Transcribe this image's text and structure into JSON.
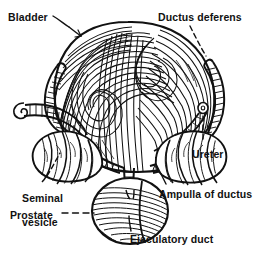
{
  "figure": {
    "kind": "anatomical-line-drawing",
    "style": "black-and-white pen-and-ink engraving with hatched muscle fibers",
    "background_color": "#ffffff",
    "ink_color": "#111111",
    "width": 256,
    "height": 254
  },
  "labels": [
    {
      "id": "bladder",
      "text": "Bladder",
      "x": 8,
      "y": 11,
      "align": "left",
      "leader": "solid",
      "points_to": "bladder-dome"
    },
    {
      "id": "ductus-deferens",
      "text": "Ductus deferens",
      "x": 158,
      "y": 11,
      "align": "left",
      "leader": "dashed",
      "points_to": "right-ductus-deferens"
    },
    {
      "id": "ureter",
      "text": "Ureter",
      "x": 192,
      "y": 148,
      "align": "left",
      "leader": "dashed",
      "points_to": "right-ureter-stump"
    },
    {
      "id": "ampulla-of-ductus",
      "text": "Ampulla of ductus",
      "x": 159,
      "y": 188,
      "align": "left",
      "leader": "solid",
      "points_to": "right-ampulla"
    },
    {
      "id": "seminal-vesicle",
      "text": "Seminal\nvesicle",
      "line1": "Seminal",
      "line2": "vesicle",
      "x": 10,
      "y": 180,
      "align": "left",
      "leader": "dashed",
      "points_to": "left-seminal-vesicle"
    },
    {
      "id": "prostate",
      "text": "Prostate",
      "x": 10,
      "y": 209,
      "align": "left",
      "leader": "dashed",
      "points_to": "prostate-gland"
    },
    {
      "id": "ejaculatory-duct",
      "text": "Ejaculatory duct",
      "x": 130,
      "y": 233,
      "align": "left",
      "leader": "solid",
      "points_to": "ejaculatory-duct-opening"
    }
  ],
  "structures": [
    {
      "id": "bladder-dome",
      "name": "Bladder"
    },
    {
      "id": "left-ureter",
      "name": "Left ureter"
    },
    {
      "id": "right-ureter-stump",
      "name": "Right ureter"
    },
    {
      "id": "left-ductus-deferens",
      "name": "Left ductus deferens"
    },
    {
      "id": "right-ductus-deferens",
      "name": "Right ductus deferens"
    },
    {
      "id": "left-seminal-vesicle",
      "name": "Left seminal vesicle"
    },
    {
      "id": "right-ampulla",
      "name": "Ampulla of ductus deferens"
    },
    {
      "id": "prostate-gland",
      "name": "Prostate"
    },
    {
      "id": "ejaculatory-duct-opening",
      "name": "Ejaculatory duct"
    }
  ]
}
